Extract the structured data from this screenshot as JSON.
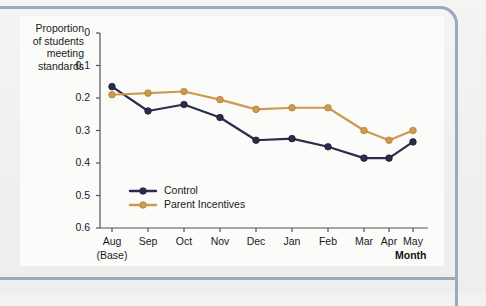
{
  "figure": {
    "border_color": "#9aa9bd",
    "panel_color": "#fbfbfa",
    "background_color": "#f1f1ef"
  },
  "axis": {
    "y_title": "Proportion\nof students\nmeeting\nstandards",
    "y_ticks": [
      "0.6",
      "0.5",
      "0.4",
      "0.3",
      "0.2",
      "0.1",
      "0"
    ],
    "x_ticks": [
      "Aug",
      "Sep",
      "Oct",
      "Nov",
      "Dec",
      "Jan",
      "Feb",
      "Mar",
      "Apr",
      "May"
    ],
    "x_tick_sublabel": "(Base)",
    "x_title": "Month"
  },
  "legend": {
    "items": [
      {
        "label": "Control",
        "color": "#2e2c4e",
        "marker": "circle"
      },
      {
        "label": "Parent Incentives",
        "color": "#cf9a4e",
        "marker": "circle"
      }
    ]
  },
  "chart_data": {
    "type": "line",
    "title": "",
    "subtitle": "",
    "xlabel": "Month",
    "ylabel": "Proportion of students meeting standards",
    "categories": [
      "Aug",
      "Sep",
      "Oct",
      "Nov",
      "Dec",
      "Jan",
      "Feb",
      "Mar",
      "Apr",
      "May"
    ],
    "x_tick_sublabels": [
      "(Base)",
      "",
      "",
      "",
      "",
      "",
      "",
      "",
      "",
      ""
    ],
    "ylim": [
      0,
      0.6
    ],
    "y_ticks": [
      0,
      0.1,
      0.2,
      0.3,
      0.4,
      0.5,
      0.6
    ],
    "grid": false,
    "legend_position": "inside-bottom-left",
    "series": [
      {
        "name": "Control",
        "color": "#2e2c4e",
        "values": [
          0.435,
          0.36,
          0.38,
          0.34,
          0.27,
          0.275,
          0.25,
          0.215,
          0.215,
          0.265
        ]
      },
      {
        "name": "Parent Incentives",
        "color": "#cf9a4e",
        "values": [
          0.41,
          0.415,
          0.42,
          0.395,
          0.365,
          0.37,
          0.37,
          0.3,
          0.27,
          0.3
        ]
      }
    ]
  }
}
